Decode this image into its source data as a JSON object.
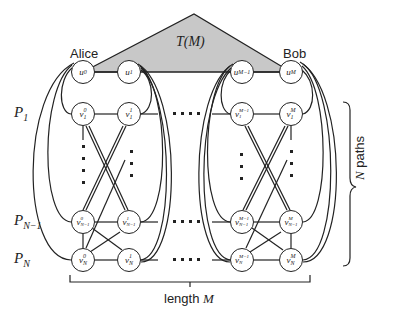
{
  "title_triangle": "T(M)",
  "endpoints": {
    "alice": "Alice",
    "bob": "Bob"
  },
  "paths": {
    "p1": "P",
    "p1_sub": "1",
    "pn1": "P",
    "pn1_sub": "N−1",
    "pn": "P",
    "pn_sub": "N"
  },
  "brackets": {
    "length_label": "length",
    "length_var": "M",
    "paths_var": "N",
    "paths_label": "paths"
  },
  "nodes": {
    "u0": {
      "base": "u",
      "sup": "0"
    },
    "u1": {
      "base": "u",
      "sup": "1"
    },
    "uM1": {
      "base": "u",
      "sup": "M−1"
    },
    "uM": {
      "base": "u",
      "sup": "M"
    },
    "v10": {
      "base": "v",
      "sup": "0",
      "sub": "1"
    },
    "v11": {
      "base": "v",
      "sup": "1",
      "sub": "1"
    },
    "v1M1": {
      "base": "v",
      "sup": "M−1",
      "sub": "1"
    },
    "v1M": {
      "base": "v",
      "sup": "M",
      "sub": "1"
    },
    "vn10": {
      "base": "v",
      "sup": "0",
      "sub": "N−1"
    },
    "vn11": {
      "base": "v",
      "sup": "1",
      "sub": "N−1"
    },
    "vn1M1": {
      "base": "v",
      "sup": "M−1",
      "sub": "N−1"
    },
    "vn1M": {
      "base": "v",
      "sup": "M",
      "sub": "N−1"
    },
    "vn0": {
      "base": "v",
      "sup": "0",
      "sub": "N"
    },
    "vn1": {
      "base": "v",
      "sup": "1",
      "sub": "N"
    },
    "vnM1": {
      "base": "v",
      "sup": "M−1",
      "sub": "N"
    },
    "vnM": {
      "base": "v",
      "sup": "M",
      "sub": "N"
    }
  },
  "colors": {
    "triangle_fill": "#c8c8c8",
    "stroke": "#222222"
  }
}
